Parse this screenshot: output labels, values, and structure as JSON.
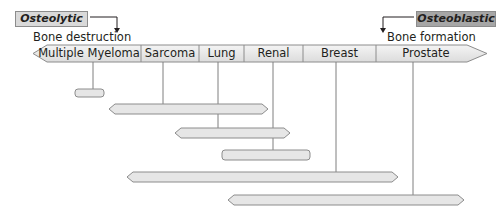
{
  "osteolytic": {
    "label": "Osteolytic",
    "description": "Bone destruction",
    "box_color": "#d9d9d9"
  },
  "osteoblastic": {
    "label": "Osteoblastic",
    "description": "Bone formation",
    "box_color": "#a6a6a6"
  },
  "spectrum": {
    "categories": [
      {
        "label": "Multiple Myeloma",
        "x_start": 33,
        "x_end": 141
      },
      {
        "label": "Sarcoma",
        "x_start": 141,
        "x_end": 199
      },
      {
        "label": "Lung",
        "x_start": 199,
        "x_end": 244
      },
      {
        "label": "Renal",
        "x_start": 244,
        "x_end": 303
      },
      {
        "label": "Breast",
        "x_start": 303,
        "x_end": 376
      },
      {
        "label": "Prostate",
        "x_start": 376,
        "x_end": 487
      }
    ]
  },
  "ranges": [
    {
      "name": "Multiple Myeloma",
      "connector_x": 93,
      "x_start": 75,
      "x_end": 104,
      "y": 89,
      "shape": "rounded"
    },
    {
      "name": "Sarcoma",
      "connector_x": 163,
      "x_start": 109,
      "x_end": 268,
      "y": 104,
      "shape": "arrow"
    },
    {
      "name": "Lung",
      "connector_x": 218,
      "x_start": 175,
      "x_end": 290,
      "y": 128,
      "shape": "arrow"
    },
    {
      "name": "Renal",
      "connector_x": 273,
      "x_start": 222,
      "x_end": 310,
      "y": 150,
      "shape": "rounded"
    },
    {
      "name": "Breast",
      "connector_x": 336,
      "x_start": 127,
      "x_end": 398,
      "y": 172,
      "shape": "arrow"
    },
    {
      "name": "Prostate",
      "connector_x": 413,
      "x_start": 228,
      "x_end": 464,
      "y": 195,
      "shape": "arrow"
    }
  ],
  "colors": {
    "bar_fill": "#e6e6e6",
    "bar_stroke": "#8c8c8c",
    "line": "#7f7f7f"
  }
}
